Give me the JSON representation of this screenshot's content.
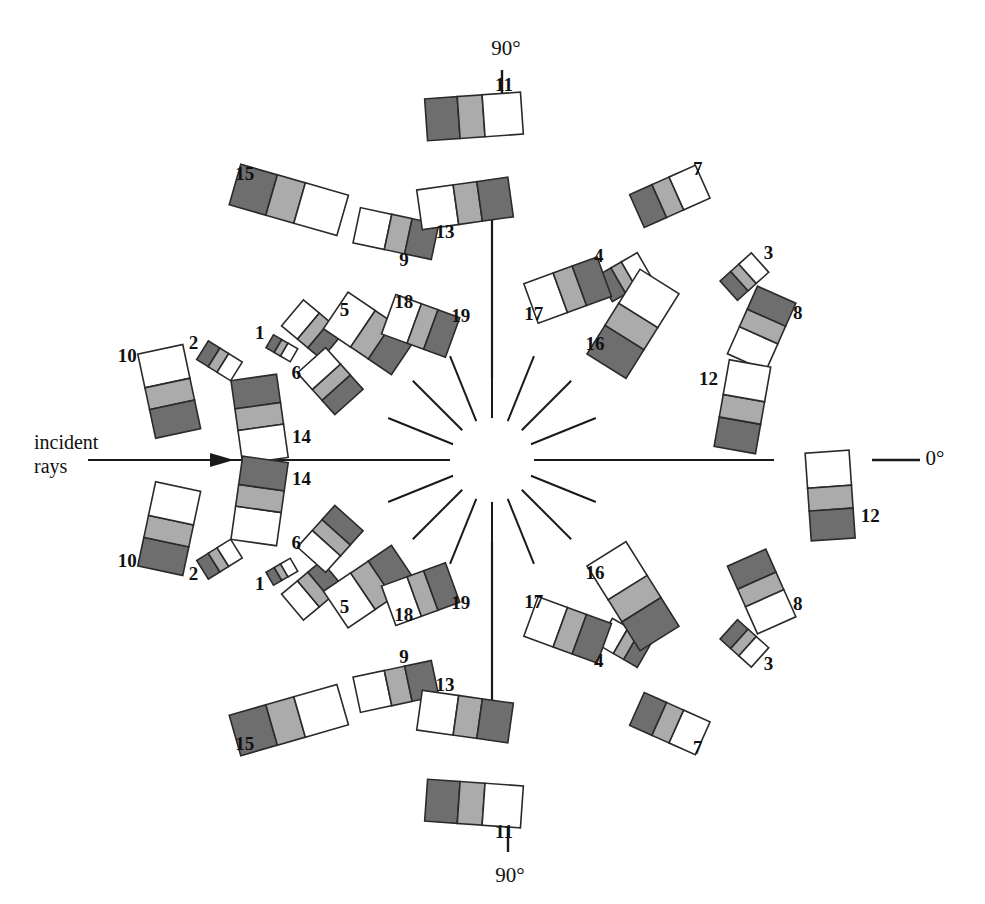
{
  "figure": {
    "background_color": "#ffffff",
    "center": {
      "x": 492,
      "y": 460
    },
    "annotations": {
      "incident_line1": "incident",
      "incident_line2": "rays",
      "angle_top": "90°",
      "angle_bottom": "90°",
      "angle_right": "0°"
    },
    "colors": {
      "segment_dark": "#6e6e6e",
      "segment_medium": "#ababab",
      "segment_light": "#ffffff",
      "outline": "#2a2a2a",
      "axis": "#1a1a1a"
    }
  },
  "chart_data": {
    "type": "bar",
    "subtitle": "Tri-segment bars arranged radially about a scattering center",
    "xlabel": "",
    "ylabel": "",
    "grid": false,
    "legend_position": "none",
    "angle_axis_labels": [
      "0°",
      "90°"
    ],
    "segment_order_note": "Each bar has three segments: dark, medium, light (white). Orientation alternates so dark may face inward or outward.",
    "segment_fractions": [
      0.34,
      0.26,
      0.4
    ],
    "categories": [
      "1",
      "2",
      "3",
      "4",
      "5",
      "6",
      "7",
      "8",
      "9",
      "10",
      "11",
      "12",
      "13",
      "14",
      "15",
      "16",
      "17",
      "18",
      "19"
    ],
    "values": [
      28,
      40,
      42,
      46,
      52,
      56,
      72,
      74,
      80,
      86,
      96,
      88,
      92,
      84,
      112,
      100,
      78,
      82,
      68
    ],
    "bars": [
      {
        "label": "1",
        "angle": 152,
        "radius": 238,
        "length": 28,
        "thickness": 15,
        "tilt": -30,
        "reversed": false,
        "label_dx": -22,
        "label_dy": -14
      },
      {
        "label": "2",
        "angle": 160,
        "radius": 290,
        "length": 40,
        "thickness": 22,
        "tilt": -32,
        "reversed": false,
        "label_dx": -26,
        "label_dy": -16
      },
      {
        "label": "15",
        "angle": 128,
        "radius": 330,
        "length": 112,
        "thickness": 42,
        "tilt": -16,
        "reversed": false,
        "label_dx": -44,
        "label_dy": -24
      },
      {
        "label": "5",
        "angle": 144,
        "radius": 222,
        "length": 52,
        "thickness": 34,
        "tilt": -40,
        "reversed": true,
        "label_dx": 32,
        "label_dy": -18
      },
      {
        "label": "9",
        "angle": 113,
        "radius": 246,
        "length": 80,
        "thickness": 36,
        "tilt": -12,
        "reversed": true,
        "label_dx": 8,
        "label_dy": 28
      },
      {
        "label": "6",
        "angle": 154,
        "radius": 180,
        "length": 56,
        "thickness": 38,
        "tilt": -48,
        "reversed": true,
        "label_dx": -34,
        "label_dy": -6
      },
      {
        "label": "18",
        "angle": 134,
        "radius": 176,
        "length": 82,
        "thickness": 44,
        "tilt": -34,
        "reversed": true,
        "label_dx": 34,
        "label_dy": -30
      },
      {
        "label": "19",
        "angle": 118,
        "radius": 152,
        "length": 68,
        "thickness": 42,
        "tilt": -20,
        "reversed": true,
        "label_dx": 40,
        "label_dy": -8
      },
      {
        "label": "10",
        "angle": 168,
        "radius": 330,
        "length": 86,
        "thickness": 46,
        "tilt": -78,
        "reversed": true,
        "label_dx": -42,
        "label_dy": -34
      },
      {
        "label": "14",
        "angle": 170,
        "radius": 236,
        "length": 84,
        "thickness": 46,
        "tilt": -82,
        "reversed": false,
        "label_dx": 42,
        "label_dy": 20
      },
      {
        "label": "11",
        "angle": 93,
        "radius": 344,
        "length": 96,
        "thickness": 42,
        "tilt": 4,
        "reversed": false,
        "label_dx": 30,
        "label_dy": -30
      },
      {
        "label": "13",
        "angle": 96,
        "radius": 258,
        "length": 92,
        "thickness": 40,
        "tilt": 8,
        "reversed": true,
        "label_dx": -20,
        "label_dy": 30
      },
      {
        "label": "7",
        "angle": 56,
        "radius": 318,
        "length": 72,
        "thickness": 36,
        "tilt": 24,
        "reversed": false,
        "label_dx": 28,
        "label_dy": -26
      },
      {
        "label": "3",
        "angle": 36,
        "radius": 312,
        "length": 42,
        "thickness": 26,
        "tilt": 42,
        "reversed": false,
        "label_dx": 24,
        "label_dy": -22
      },
      {
        "label": "4",
        "angle": 54,
        "radius": 226,
        "length": 46,
        "thickness": 30,
        "tilt": 30,
        "reversed": false,
        "label_dx": -26,
        "label_dy": -20
      },
      {
        "label": "17",
        "angle": 66,
        "radius": 186,
        "length": 78,
        "thickness": 42,
        "tilt": 20,
        "reversed": true,
        "label_dx": -34,
        "label_dy": 26
      },
      {
        "label": "16",
        "angle": 44,
        "radius": 196,
        "length": 100,
        "thickness": 46,
        "tilt": 58,
        "reversed": false,
        "label_dx": -38,
        "label_dy": 22
      },
      {
        "label": "8",
        "angle": 26,
        "radius": 300,
        "length": 74,
        "thickness": 42,
        "tilt": 66,
        "reversed": true,
        "label_dx": 36,
        "label_dy": -14
      },
      {
        "label": "12",
        "angle": 12,
        "radius": 256,
        "length": 88,
        "thickness": 42,
        "tilt": 80,
        "reversed": false,
        "label_dx": -34,
        "label_dy": -26
      },
      {
        "label": "12",
        "angle": -6,
        "radius": 340,
        "length": 88,
        "thickness": 44,
        "tilt": -86,
        "reversed": true,
        "label_dx": 40,
        "label_dy": 22
      },
      {
        "label": "1",
        "angle": -152,
        "radius": 238,
        "length": 28,
        "thickness": 15,
        "tilt": 30,
        "reversed": false,
        "label_dx": -22,
        "label_dy": 14
      },
      {
        "label": "2",
        "angle": -160,
        "radius": 290,
        "length": 40,
        "thickness": 22,
        "tilt": 32,
        "reversed": false,
        "label_dx": -26,
        "label_dy": 16
      },
      {
        "label": "15",
        "angle": -128,
        "radius": 330,
        "length": 112,
        "thickness": 42,
        "tilt": 16,
        "reversed": false,
        "label_dx": -44,
        "label_dy": 26
      },
      {
        "label": "5",
        "angle": -144,
        "radius": 222,
        "length": 52,
        "thickness": 34,
        "tilt": 40,
        "reversed": true,
        "label_dx": 32,
        "label_dy": 18
      },
      {
        "label": "9",
        "angle": -113,
        "radius": 246,
        "length": 80,
        "thickness": 36,
        "tilt": 12,
        "reversed": true,
        "label_dx": 8,
        "label_dy": -28
      },
      {
        "label": "6",
        "angle": -154,
        "radius": 180,
        "length": 56,
        "thickness": 38,
        "tilt": 48,
        "reversed": true,
        "label_dx": -34,
        "label_dy": 6
      },
      {
        "label": "18",
        "angle": -134,
        "radius": 176,
        "length": 82,
        "thickness": 44,
        "tilt": 34,
        "reversed": true,
        "label_dx": 34,
        "label_dy": 30
      },
      {
        "label": "19",
        "angle": -118,
        "radius": 152,
        "length": 68,
        "thickness": 42,
        "tilt": 20,
        "reversed": true,
        "label_dx": 40,
        "label_dy": 10
      },
      {
        "label": "10",
        "angle": -168,
        "radius": 330,
        "length": 86,
        "thickness": 46,
        "tilt": 78,
        "reversed": false,
        "label_dx": -42,
        "label_dy": 34
      },
      {
        "label": "14",
        "angle": -170,
        "radius": 236,
        "length": 84,
        "thickness": 46,
        "tilt": 82,
        "reversed": true,
        "label_dx": 42,
        "label_dy": -20
      },
      {
        "label": "11",
        "angle": -93,
        "radius": 344,
        "length": 96,
        "thickness": 42,
        "tilt": -4,
        "reversed": false,
        "label_dx": 30,
        "label_dy": 30
      },
      {
        "label": "13",
        "angle": -96,
        "radius": 258,
        "length": 92,
        "thickness": 40,
        "tilt": -8,
        "reversed": true,
        "label_dx": -20,
        "label_dy": -30
      },
      {
        "label": "7",
        "angle": -56,
        "radius": 318,
        "length": 72,
        "thickness": 36,
        "tilt": -24,
        "reversed": false,
        "label_dx": 28,
        "label_dy": 26
      },
      {
        "label": "3",
        "angle": -36,
        "radius": 312,
        "length": 42,
        "thickness": 26,
        "tilt": -42,
        "reversed": false,
        "label_dx": 24,
        "label_dy": 22
      },
      {
        "label": "4",
        "angle": -54,
        "radius": 226,
        "length": 46,
        "thickness": 30,
        "tilt": -30,
        "reversed": true,
        "label_dx": -26,
        "label_dy": 20
      },
      {
        "label": "17",
        "angle": -66,
        "radius": 186,
        "length": 78,
        "thickness": 42,
        "tilt": -20,
        "reversed": true,
        "label_dx": -34,
        "label_dy": -26
      },
      {
        "label": "16",
        "angle": -44,
        "radius": 196,
        "length": 100,
        "thickness": 46,
        "tilt": -58,
        "reversed": true,
        "label_dx": -38,
        "label_dy": -22
      },
      {
        "label": "8",
        "angle": -26,
        "radius": 300,
        "length": 74,
        "thickness": 42,
        "tilt": -66,
        "reversed": false,
        "label_dx": 36,
        "label_dy": 14
      }
    ],
    "spokes": [
      {
        "angle": 90,
        "r_inner": 42,
        "r_outer": 112
      },
      {
        "angle": 68,
        "r_inner": 42,
        "r_outer": 112
      },
      {
        "angle": 45,
        "r_inner": 42,
        "r_outer": 112
      },
      {
        "angle": 22,
        "r_inner": 42,
        "r_outer": 112
      },
      {
        "angle": 0,
        "r_inner": 42,
        "r_outer": 112
      },
      {
        "angle": -22,
        "r_inner": 42,
        "r_outer": 112
      },
      {
        "angle": -45,
        "r_inner": 42,
        "r_outer": 112
      },
      {
        "angle": -68,
        "r_inner": 42,
        "r_outer": 112
      },
      {
        "angle": -90,
        "r_inner": 42,
        "r_outer": 112
      },
      {
        "angle": 112,
        "r_inner": 42,
        "r_outer": 112
      },
      {
        "angle": 135,
        "r_inner": 42,
        "r_outer": 112
      },
      {
        "angle": 158,
        "r_inner": 42,
        "r_outer": 112
      },
      {
        "angle": 180,
        "r_inner": 42,
        "r_outer": 112
      },
      {
        "angle": -158,
        "r_inner": 42,
        "r_outer": 112
      },
      {
        "angle": -135,
        "r_inner": 42,
        "r_outer": 112
      },
      {
        "angle": -112,
        "r_inner": 42,
        "r_outer": 112
      }
    ]
  }
}
